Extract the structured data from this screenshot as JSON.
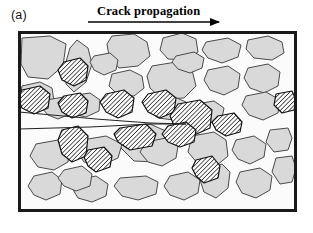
{
  "figure": {
    "panel_label": "(a)",
    "arrow_caption": "Crack propagation",
    "caption_font": "serif-bold",
    "arrow": {
      "name": "crack-propagation-arrow",
      "x1": 88,
      "y1": 22,
      "x2": 228,
      "y2": 22,
      "head_length": 9,
      "head_width": 7,
      "color": "#000000"
    }
  },
  "colors": {
    "background": "#ffffff",
    "frame_border": "#1a1a1a",
    "matrix_fill": "#fbfbfb",
    "soft_particle_fill": "#d9d9d9",
    "soft_particle_stroke": "#4a4a4a",
    "hatched_particle_fill": "#ffffff",
    "hatched_particle_stroke": "#111111",
    "hatch_line": "#111111",
    "crack_stroke": "#222222"
  },
  "frame": {
    "name": "microstructure-frame",
    "x": 18,
    "y": 31,
    "width": 279,
    "height": 181,
    "stroke_width": 3
  },
  "crack": {
    "name": "crack-wedge",
    "description": "wedge-shaped crack entering from left edge, tip at large hatched particle",
    "upper": [
      [
        19,
        112
      ],
      [
        96,
        119
      ],
      [
        150,
        123
      ],
      [
        186,
        124
      ]
    ],
    "lower": [
      [
        19,
        129
      ],
      [
        90,
        127
      ],
      [
        150,
        124
      ],
      [
        186,
        124
      ]
    ],
    "tip": [
      186,
      124
    ],
    "stroke_width": 1.0
  },
  "legend_semantics": {
    "soft_particle": "light-gray inclusion / matrix grain",
    "hatched_particle": "dark hatched reinforcement particle"
  },
  "particles": {
    "soft": [
      {
        "id": "s1",
        "points": "22,38 50,36 66,44 63,66 48,79 28,77 21,64"
      },
      {
        "id": "s2",
        "points": "77,40 88,48 92,64 86,82 74,92 66,84 66,62 70,48"
      },
      {
        "id": "s3",
        "points": "112,36 134,34 147,42 150,56 138,66 119,68 109,56 107,44"
      },
      {
        "id": "s4",
        "points": "163,38 182,33 196,39 198,52 186,60 168,59 160,50"
      },
      {
        "id": "s5",
        "points": "206,42 228,38 241,45 238,57 222,63 208,58 202,50"
      },
      {
        "id": "s6",
        "points": "248,40 268,36 282,42 284,53 272,60 254,58 246,49"
      },
      {
        "id": "s7",
        "points": "22,86 40,82 52,88 54,101 44,110 28,109 20,99"
      },
      {
        "id": "s8",
        "points": "112,74 130,70 142,76 144,88 134,96 118,95 109,86"
      },
      {
        "id": "s9",
        "points": "152,66 176,62 192,70 196,86 184,98 162,99 150,88 147,76"
      },
      {
        "id": "s10",
        "points": "208,70 228,66 240,74 238,88 224,95 210,90 204,80"
      },
      {
        "id": "s11",
        "points": "248,68 268,64 280,72 278,86 264,93 250,88 244,78"
      },
      {
        "id": "s12",
        "points": "70,96 90,93 100,100 99,111 86,117 72,114 66,105"
      },
      {
        "id": "s13",
        "points": "152,100 172,96 186,102 188,114 174,120 158,118 148,110"
      },
      {
        "id": "s14",
        "points": "246,96 266,92 280,100 278,113 263,120 249,115 242,105"
      },
      {
        "id": "s15",
        "points": "196,104 214,101 224,108 222,118 210,123 198,119 192,112"
      },
      {
        "id": "s16",
        "points": "124,128 150,124 168,132 170,150 156,162 134,161 121,148 118,136"
      },
      {
        "id": "s17",
        "points": "192,136 214,132 226,140 228,156 216,166 198,164 188,152"
      },
      {
        "id": "s18",
        "points": "236,140 254,136 266,144 264,157 250,164 238,159 232,150"
      },
      {
        "id": "s19",
        "points": "270,130 288,128 292,138 288,150 274,152 266,142"
      },
      {
        "id": "s20",
        "points": "36,144 58,140 70,148 68,162 54,170 38,167 30,156"
      },
      {
        "id": "s21",
        "points": "82,140 106,136 122,144 118,158 100,166 84,162 76,150"
      },
      {
        "id": "s22",
        "points": "146,142 166,138 178,146 176,158 162,166 148,162 140,152"
      },
      {
        "id": "s23",
        "points": "34,176 52,172 62,180 60,194 46,200 34,195 28,186"
      },
      {
        "id": "s24",
        "points": "76,180 96,176 108,184 106,196 92,202 78,198 72,188"
      },
      {
        "id": "s25",
        "points": "120,178 146,176 158,182 156,194 138,200 122,196 114,186"
      },
      {
        "id": "s26",
        "points": "170,176 188,172 200,180 198,193 184,200 170,195 164,186"
      },
      {
        "id": "s27",
        "points": "206,170 222,164 230,172 228,188 216,198 204,192 200,180"
      },
      {
        "id": "s28",
        "points": "240,172 260,168 272,176 270,190 256,198 242,193 236,182"
      },
      {
        "id": "s29",
        "points": "276,158 292,156 296,168 292,182 280,184 272,172"
      },
      {
        "id": "s30",
        "points": "64,170 82,166 92,174 90,186 76,191 64,186 58,178"
      },
      {
        "id": "s31",
        "points": "176,56 194,52 204,58 202,68 190,73 178,69 172,62"
      },
      {
        "id": "s32",
        "points": "94,56 110,53 118,60 116,70 104,75 94,70 90,62"
      },
      {
        "id": "s33",
        "points": "46,100 64,97 72,104 70,114 58,119 48,115 42,108"
      }
    ],
    "hatched": [
      {
        "id": "h1",
        "points": "64,62 80,58 88,66 86,80 74,86 62,80 58,70"
      },
      {
        "id": "h2",
        "points": "22,90 40,86 50,94 48,108 34,114 22,108 18,98"
      },
      {
        "id": "h3",
        "points": "64,96 80,93 88,101 86,113 72,118 62,112 58,103"
      },
      {
        "id": "h4",
        "points": "106,94 124,90 134,98 132,112 118,118 106,112 100,102"
      },
      {
        "id": "h5",
        "points": "148,94 166,90 176,98 174,112 160,118 148,112 142,102"
      },
      {
        "id": "h6",
        "points": "178,104 200,100 212,110 210,128 192,136 176,130 170,116"
      },
      {
        "id": "h7",
        "points": "218,116 234,113 242,122 240,132 226,136 216,130 212,122"
      },
      {
        "id": "h8",
        "points": "62,130 78,126 88,136 86,156 72,162 62,154 58,140"
      },
      {
        "id": "h9",
        "points": "120,128 146,124 156,134 152,146 130,150 118,142 114,134"
      },
      {
        "id": "h10",
        "points": "168,126 186,122 196,130 194,142 180,147 168,142 162,134"
      },
      {
        "id": "h11",
        "points": "88,150 104,147 112,156 110,167 96,172 88,166 84,157"
      },
      {
        "id": "h12",
        "points": "196,160 212,156 220,166 218,178 204,183 196,176 192,168"
      },
      {
        "id": "h13",
        "points": "276,94 292,91 296,100 294,110 282,113 274,105"
      }
    ],
    "hatch_angle_deg": 45,
    "hatch_spacing_px": 2.2
  }
}
